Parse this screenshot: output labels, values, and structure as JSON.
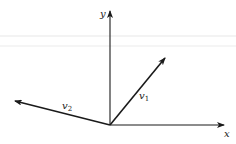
{
  "diagram": {
    "colors": {
      "background": "#ffffff",
      "ink": "#1a1a1a",
      "scan_artifact": "#ececec"
    },
    "axes": {
      "origin": {
        "x": 110,
        "y": 125
      },
      "x_axis": {
        "label": "x",
        "end": {
          "x": 225,
          "y": 125
        }
      },
      "y_axis": {
        "label": "y",
        "end": {
          "x": 110,
          "y": 10
        }
      }
    },
    "vectors": [
      {
        "name": "v1",
        "base": "v",
        "subscript": "1",
        "from": {
          "x": 110,
          "y": 125
        },
        "to": {
          "x": 166,
          "y": 57
        }
      },
      {
        "name": "v2",
        "base": "v",
        "subscript": "2",
        "from": {
          "x": 110,
          "y": 125
        },
        "to": {
          "x": 14,
          "y": 101
        }
      }
    ]
  }
}
